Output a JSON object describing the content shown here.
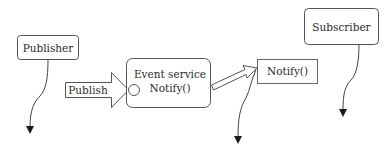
{
  "diagram": {
    "type": "publish-subscribe event service",
    "nodes": {
      "publisher": {
        "label": "Publisher"
      },
      "publish_arrow": {
        "label": "Publish"
      },
      "event_service": {
        "line1": "Event service",
        "line2": "Notify()"
      },
      "notify_box": {
        "label": "Notify()"
      },
      "subscriber": {
        "label": "Subscriber"
      }
    },
    "edges": [
      {
        "from": "publisher",
        "to": "below",
        "style": "curved-line-filled-arrowhead"
      },
      {
        "from": "publish_arrow",
        "to": "event_service",
        "style": "block-arrow"
      },
      {
        "from": "event_service",
        "to": "notify_box",
        "style": "block-arrow"
      },
      {
        "from": "notify_box",
        "to": "below",
        "style": "curved-line-filled-arrowhead"
      },
      {
        "from": "subscriber",
        "to": "below",
        "style": "curved-line-filled-arrowhead"
      }
    ],
    "colors": {
      "stroke": "#555555",
      "arrowhead": "#1a1a1a",
      "text": "#2b2b2b",
      "background": "#ffffff"
    }
  }
}
